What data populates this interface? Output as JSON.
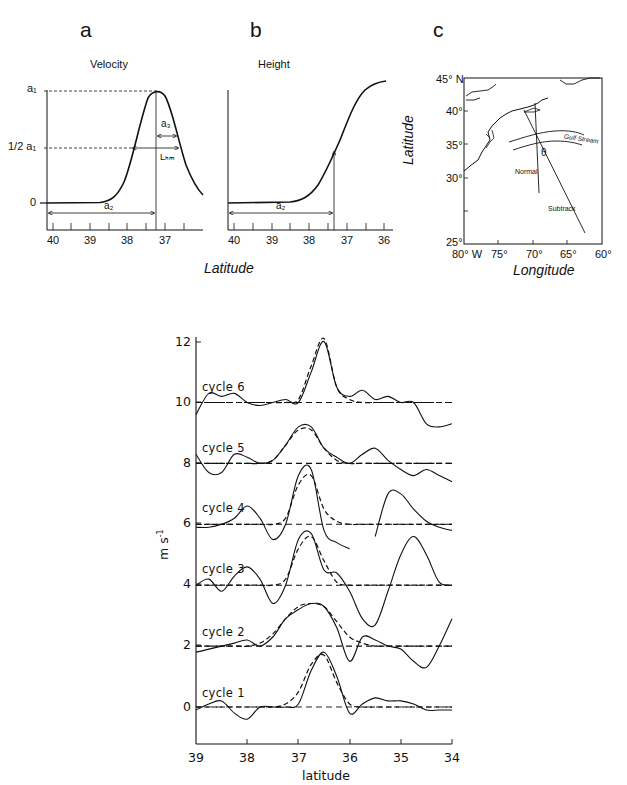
{
  "panels": {
    "a": {
      "letter": "a",
      "title": "Velocity",
      "y_labels": {
        "a1": "a₁",
        "half_a1": "1/2 a₁",
        "zero": "0"
      },
      "annotations": {
        "a3": "a₃",
        "lhm": "Lₕₘ",
        "a2": "a₂"
      },
      "x_ticks": [
        "40",
        "39",
        "38",
        "37"
      ]
    },
    "b": {
      "letter": "b",
      "title": "Height",
      "annotations": {
        "a2": "a₂"
      },
      "x_ticks": [
        "40",
        "39",
        "38",
        "37",
        "36"
      ]
    },
    "ab_xlabel": "Latitude",
    "c": {
      "letter": "c",
      "y_ticks": [
        "45° N",
        "40°",
        "35°",
        "30°",
        "25°"
      ],
      "x_ticks": [
        "80° W",
        "75°",
        "70°",
        "65°",
        "60°"
      ],
      "ylabel": "Latitude",
      "xlabel": "Longitude",
      "labels": {
        "gulf_stream": "Gulf Stream",
        "normal": "Normal",
        "subtrack": "Subtrack",
        "theta": "θ"
      }
    }
  },
  "chart_data": [
    {
      "type": "line",
      "title": "a: Velocity (schematic Gaussian jet)",
      "xlabel": "Latitude",
      "ylabel": "",
      "x_ticks": [
        40,
        39,
        38,
        37
      ],
      "y_tick_labels": [
        "0",
        "1/2 a1",
        "a1"
      ],
      "series": [
        {
          "name": "velocity",
          "x": [
            40.2,
            39.5,
            39.0,
            38.5,
            38.0,
            37.6,
            37.25,
            36.9,
            36.5,
            36.0
          ],
          "values": [
            0,
            0,
            0.01,
            0.12,
            0.5,
            0.9,
            1.0,
            0.85,
            0.45,
            0.12
          ]
        }
      ],
      "annotations": [
        "a1 = peak amplitude",
        "a2 = distance to jet axis",
        "a3 = half width",
        "L_HM"
      ]
    },
    {
      "type": "line",
      "title": "b: Height (schematic hyperbolic-tangent profile)",
      "xlabel": "Latitude",
      "x_ticks": [
        40,
        39,
        38,
        37,
        36
      ],
      "series": [
        {
          "name": "height",
          "x": [
            40.2,
            39.0,
            38.5,
            38.0,
            37.5,
            37.25,
            37.0,
            36.5,
            36.0
          ],
          "values": [
            0,
            0.01,
            0.04,
            0.15,
            0.38,
            0.5,
            0.65,
            0.9,
            1.0
          ]
        }
      ]
    },
    {
      "type": "map",
      "title": "c: Gulf Stream and altimeter subtrack",
      "xlabel": "Longitude",
      "ylabel": "Latitude",
      "xlim": [
        -80,
        -60
      ],
      "ylim": [
        25,
        45
      ],
      "x_ticks": [
        "80° W",
        "75°",
        "70°",
        "65°",
        "60°"
      ],
      "y_ticks": [
        "45° N",
        "40°",
        "35°",
        "30°",
        "25°"
      ],
      "annotations": [
        "Gulf Stream",
        "Normal",
        "Subtrack",
        "θ"
      ]
    },
    {
      "type": "line",
      "title": "Velocity profiles by cycle (offset by 2 m/s each)",
      "xlabel": "latitude",
      "ylabel": "m s-1",
      "xlim": [
        39,
        34
      ],
      "ylim": [
        -1.2,
        12.5
      ],
      "x_ticks": [
        39,
        38,
        37,
        36,
        35,
        34
      ],
      "y_ticks": [
        0,
        2,
        4,
        6,
        8,
        10,
        12
      ],
      "grid": false,
      "x": [
        39.0,
        38.75,
        38.5,
        38.25,
        38.0,
        37.75,
        37.5,
        37.25,
        37.0,
        36.75,
        36.5,
        36.25,
        36.0,
        35.75,
        35.5,
        35.25,
        35.0,
        34.75,
        34.5,
        34.25,
        34.0
      ],
      "series": [
        {
          "name": "cycle 1",
          "offset": 0,
          "observed": [
            -0.1,
            0.1,
            0.2,
            -0.2,
            -0.4,
            0.0,
            0.0,
            0.0,
            0.1,
            1.2,
            1.8,
            1.0,
            -0.2,
            0.1,
            0.3,
            0.2,
            0.2,
            0.1,
            -0.1,
            -0.1,
            -0.1
          ],
          "fit": [
            0,
            0,
            0,
            0,
            0,
            0,
            0,
            0.1,
            0.5,
            1.4,
            1.7,
            0.8,
            0.1,
            0,
            0,
            0,
            0,
            0,
            0,
            0,
            0
          ]
        },
        {
          "name": "cycle 2",
          "offset": 2,
          "observed": [
            1.8,
            1.9,
            2.0,
            2.1,
            2.2,
            2.0,
            2.3,
            2.9,
            3.2,
            3.4,
            3.3,
            2.6,
            1.5,
            2.3,
            2.2,
            2.0,
            1.9,
            1.5,
            1.3,
            2.0,
            2.9
          ],
          "fit": [
            2,
            2,
            2,
            2,
            2,
            2.1,
            2.4,
            2.9,
            3.3,
            3.4,
            3.3,
            2.8,
            2.3,
            2.1,
            2,
            2,
            2,
            2,
            2,
            2,
            2
          ]
        },
        {
          "name": "cycle 3",
          "offset": 4,
          "observed": [
            4.0,
            4.2,
            3.8,
            4.3,
            4.6,
            4.2,
            3.4,
            4.0,
            5.5,
            5.7,
            4.5,
            4.4,
            3.8,
            2.9,
            2.7,
            3.8,
            5.0,
            5.6,
            5.0,
            4.1,
            4.0
          ],
          "fit": [
            4,
            4,
            4,
            4,
            4,
            4,
            4,
            4.2,
            5.2,
            5.6,
            4.8,
            4.1,
            4,
            4,
            4,
            4,
            4,
            4,
            4,
            4,
            4
          ]
        },
        {
          "name": "cycle 4",
          "offset": 6,
          "observed": [
            5.9,
            5.9,
            6.0,
            6.2,
            6.6,
            6.2,
            5.5,
            6.0,
            7.6,
            7.8,
            5.8,
            5.4,
            5.2,
            null,
            5.6,
            7.0,
            7.0,
            6.5,
            6.1,
            5.9,
            5.8
          ],
          "fit": [
            6,
            6,
            6,
            6,
            6,
            6,
            6,
            6.2,
            7.3,
            7.6,
            6.5,
            6.1,
            6,
            6,
            6,
            6,
            6,
            6,
            6,
            6,
            6
          ]
        },
        {
          "name": "cycle 5",
          "offset": 8,
          "observed": [
            8.3,
            7.7,
            7.7,
            8.3,
            8.2,
            8.0,
            8.1,
            8.6,
            9.2,
            9.2,
            8.5,
            8.2,
            8.0,
            8.3,
            8.5,
            8.1,
            7.8,
            7.6,
            7.8,
            7.6,
            7.4
          ],
          "fit": [
            8,
            8,
            8,
            8,
            8,
            8,
            8.1,
            8.6,
            9.1,
            9.1,
            8.5,
            8.1,
            8,
            8,
            8,
            8,
            8,
            8,
            8,
            8,
            8
          ]
        },
        {
          "name": "cycle 6",
          "offset": 10,
          "observed": [
            9.6,
            10.3,
            10.2,
            10.3,
            10.0,
            9.9,
            10.0,
            10.1,
            10.0,
            11.0,
            12.0,
            10.5,
            10.2,
            10.4,
            10.1,
            10.2,
            10.0,
            10.0,
            9.3,
            9.2,
            9.3
          ],
          "fit": [
            10,
            10,
            10,
            10,
            10,
            10,
            10,
            10,
            10.1,
            11.2,
            12.1,
            10.5,
            10.1,
            10,
            10,
            10,
            10,
            10,
            10,
            10,
            10
          ]
        }
      ]
    }
  ],
  "bottom": {
    "ylabel_main": "m s",
    "ylabel_sup": "-1",
    "xlabel": "latitude",
    "x_ticks": [
      "39",
      "38",
      "37",
      "36",
      "35",
      "34"
    ],
    "y_ticks": [
      "0",
      "2",
      "4",
      "6",
      "8",
      "10",
      "12"
    ],
    "cycle_labels": [
      "cycle  1",
      "cycle  2",
      "cycle  3",
      "cycle  4",
      "cycle  5",
      "cycle  6"
    ]
  }
}
